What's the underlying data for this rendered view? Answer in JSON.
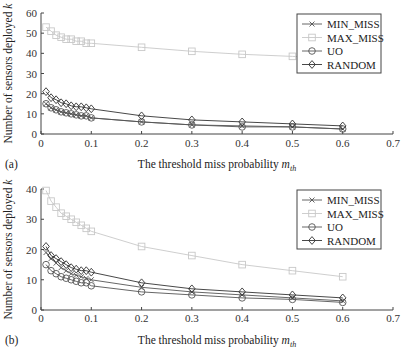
{
  "chart_data": [
    {
      "panel_label": "(a)",
      "type": "line",
      "xlabel": "The threshold miss probability m_th",
      "xlabel_main": "The threshold miss probability ",
      "xlabel_var": "m",
      "xlabel_sub": "th",
      "ylabel": "Number of sensors deployed k",
      "ylabel_main": "Number of sensors deployed ",
      "ylabel_var": "k",
      "xlim": [
        0,
        0.7
      ],
      "ylim": [
        0,
        60
      ],
      "xticks": [
        "0",
        "0.1",
        "0.2",
        "0.3",
        "0.4",
        "0.5",
        "0.6",
        "0.7"
      ],
      "yticks": [
        "0",
        "10",
        "20",
        "30",
        "40",
        "50",
        "60"
      ],
      "grid": false,
      "legend_position": "upper right",
      "x": [
        0.01,
        0.02,
        0.03,
        0.04,
        0.05,
        0.06,
        0.07,
        0.08,
        0.09,
        0.1,
        0.2,
        0.3,
        0.4,
        0.5,
        0.6
      ],
      "series": [
        {
          "name": "MIN_MISS",
          "marker": "x",
          "color": "#555555",
          "values": [
            15,
            13,
            12,
            11,
            10.5,
            10,
            9.5,
            9,
            9,
            8,
            6,
            4.5,
            4,
            3.5,
            2.5
          ]
        },
        {
          "name": "MAX_MISS",
          "marker": "square",
          "color": "#c8c8c8",
          "values": [
            53,
            51,
            49,
            48,
            47,
            47,
            46,
            46,
            45,
            45,
            43,
            41,
            39.5,
            38.5,
            37.5
          ]
        },
        {
          "name": "UO",
          "marker": "circle",
          "color": "#555555",
          "values": [
            15,
            13,
            12,
            11,
            10.5,
            10,
            9.5,
            9,
            9,
            8,
            6,
            4.5,
            3.5,
            3.5,
            2.5
          ]
        },
        {
          "name": "RANDOM",
          "marker": "diamond",
          "color": "#333333",
          "values": [
            21,
            18,
            17,
            15.5,
            15,
            14,
            13.5,
            13.5,
            13,
            12.5,
            9,
            7,
            6,
            5,
            4
          ]
        }
      ]
    },
    {
      "panel_label": "(b)",
      "type": "line",
      "xlabel": "The threshold miss probability m_th",
      "xlabel_main": "The threshold miss probability ",
      "xlabel_var": "m",
      "xlabel_sub": "th",
      "ylabel": "Number of sensors deployed k",
      "ylabel_main": "Number of sensors deployed ",
      "ylabel_var": "k",
      "xlim": [
        0,
        0.7
      ],
      "ylim": [
        0,
        40
      ],
      "xticks": [
        "0",
        "0.1",
        "0.2",
        "0.3",
        "0.4",
        "0.5",
        "0.6",
        "0.7"
      ],
      "yticks": [
        "0",
        "10",
        "20",
        "30",
        "40"
      ],
      "grid": false,
      "legend_position": "upper right",
      "x": [
        0.01,
        0.02,
        0.03,
        0.04,
        0.05,
        0.06,
        0.07,
        0.08,
        0.09,
        0.1,
        0.2,
        0.3,
        0.4,
        0.5,
        0.6
      ],
      "series": [
        {
          "name": "MIN_MISS",
          "marker": "x",
          "color": "#555555",
          "values": [
            19,
            17,
            15.5,
            14,
            13,
            12,
            11.5,
            11,
            10.5,
            10,
            7.5,
            6,
            5,
            4,
            3
          ]
        },
        {
          "name": "MAX_MISS",
          "marker": "square",
          "color": "#c8c8c8",
          "values": [
            39.5,
            36,
            34,
            32,
            31,
            30,
            29,
            28,
            27,
            26,
            21,
            18,
            15,
            13,
            11
          ]
        },
        {
          "name": "UO",
          "marker": "circle",
          "color": "#555555",
          "values": [
            15,
            13,
            12,
            11,
            10.5,
            10,
            9.5,
            9,
            9,
            8,
            6,
            5,
            4,
            3.5,
            2.5
          ]
        },
        {
          "name": "RANDOM",
          "marker": "diamond",
          "color": "#333333",
          "values": [
            21,
            18,
            17,
            16,
            15,
            14,
            13.5,
            13,
            13,
            12.5,
            9,
            7,
            6,
            5,
            4
          ]
        }
      ]
    }
  ]
}
